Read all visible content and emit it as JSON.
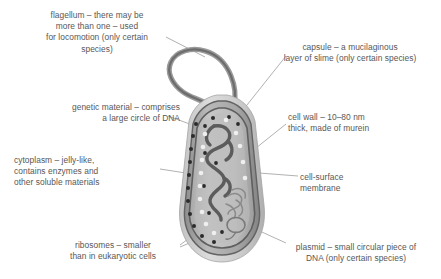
{
  "diagram": {
    "palette": {
      "background": "#ffffff",
      "text": "#575757",
      "leader_line": "#8f8f8f",
      "capsule_fill": "#cfcfcf",
      "cell_wall_fill": "#9a9a9a",
      "membrane_stroke": "#6e6e6e",
      "cytoplasm_fill": "#b4b4b4",
      "dna_stroke": "#5a5a5a",
      "ribosome_dark": "#2e2e2e",
      "ribosome_light": "#ececec",
      "flagellum_stroke": "#808080"
    },
    "labels": [
      {
        "id": "flagellum",
        "text": "flagellum – there may be\nmore than one – used\nfor locomotion (only certain\nspecies)",
        "align": "center"
      },
      {
        "id": "genetic-material",
        "text": "genetic material – comprises\na large circle of DNA",
        "align": "right"
      },
      {
        "id": "cytoplasm",
        "text": "cytoplasm – jelly-like,\ncontains enzymes and\nother soluble materials",
        "align": "left"
      },
      {
        "id": "ribosomes",
        "text": "ribosomes – smaller\nthan in eukaryotic cells",
        "align": "center"
      },
      {
        "id": "capsule",
        "text": "capsule – a mucilaginous\nlayer of slime (only certain species)",
        "align": "center"
      },
      {
        "id": "cell-wall",
        "text": "cell wall – 10–80 nm\nthick, made of murein",
        "align": "left"
      },
      {
        "id": "cell-surface-membrane",
        "text": "cell-surface\nmembrane",
        "align": "left"
      },
      {
        "id": "plasmid",
        "text": "plasmid – small circular piece of\nDNA (only certain species)",
        "align": "center"
      }
    ],
    "structures": [
      {
        "id": "flagellum",
        "name": "flagellum"
      },
      {
        "id": "capsule",
        "name": "capsule"
      },
      {
        "id": "cell-wall",
        "name": "cell wall"
      },
      {
        "id": "cell-surface-membrane",
        "name": "cell-surface membrane"
      },
      {
        "id": "cytoplasm",
        "name": "cytoplasm"
      },
      {
        "id": "genetic-material",
        "name": "circular DNA"
      },
      {
        "id": "plasmid",
        "name": "plasmid"
      },
      {
        "id": "ribosomes",
        "name": "ribosomes"
      }
    ]
  }
}
